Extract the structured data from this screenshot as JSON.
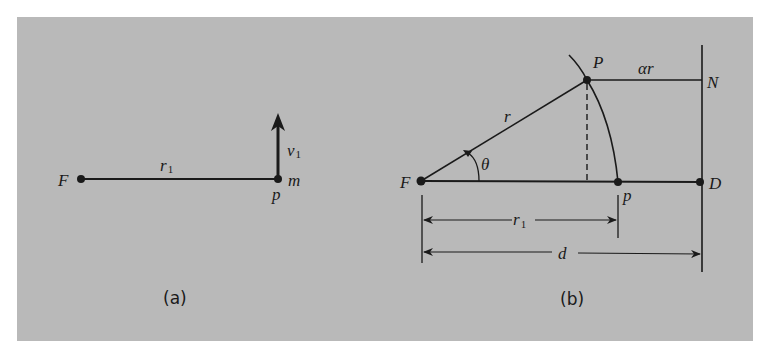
{
  "figure": {
    "background_color": "#b9b9b9",
    "line_color": "#1a1a1a",
    "panel_a": {
      "caption": "(a)",
      "labels": {
        "focus": "F",
        "radius": "r",
        "radius_sub": "1",
        "velocity": "v",
        "velocity_sub": "1",
        "mass": "m",
        "point": "p"
      }
    },
    "panel_b": {
      "caption": "(b)",
      "labels": {
        "focus": "F",
        "point_upper": "P",
        "point_lower": "p",
        "radius": "r",
        "angle": "θ",
        "alpha_r": "αr",
        "directrix_top": "N",
        "directrix_foot": "D",
        "r1_dim": "r",
        "r1_dim_sub": "1",
        "d_dim": "d"
      }
    }
  }
}
